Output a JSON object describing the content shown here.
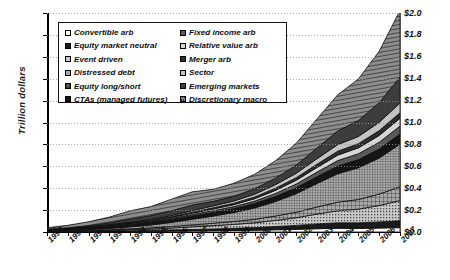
{
  "chart_data": {
    "type": "area",
    "stacked": true,
    "title": "",
    "xlabel": "",
    "ylabel": "Trillion dollars",
    "ylim": [
      0.0,
      2.0
    ],
    "ytick_step": 0.2,
    "grid": true,
    "legend_position": "top-left-inside",
    "x": [
      1990,
      1991,
      1992,
      1993,
      1994,
      1995,
      1996,
      1997,
      1998,
      1999,
      2000,
      2001,
      2002,
      2003,
      2004,
      2005,
      2006,
      2007
    ],
    "yticks": [
      "$0.0",
      "$0.2",
      "$0.4",
      "$0.6",
      "$0.8",
      "$1.0",
      "$1.2",
      "$1.4",
      "$1.6",
      "$1.8",
      "$2.0"
    ],
    "xticklabels": [
      "1990",
      "1991",
      "1992",
      "1993",
      "1994",
      "1995",
      "1996",
      "1997",
      "1998",
      "1999",
      "2000",
      "2001",
      "2002",
      "2003",
      "2004",
      "2005",
      "2006",
      "2007"
    ],
    "series": [
      {
        "name": "Convertible arb",
        "fill": "#ffffff",
        "pattern": "solid",
        "values": [
          0.001,
          0.002,
          0.003,
          0.004,
          0.005,
          0.006,
          0.008,
          0.01,
          0.012,
          0.014,
          0.016,
          0.02,
          0.024,
          0.03,
          0.034,
          0.032,
          0.036,
          0.04
        ]
      },
      {
        "name": "Equity market neutral",
        "fill": "#1a1a1a",
        "pattern": "solid",
        "values": [
          0.001,
          0.002,
          0.003,
          0.004,
          0.006,
          0.008,
          0.01,
          0.013,
          0.016,
          0.02,
          0.024,
          0.03,
          0.036,
          0.044,
          0.05,
          0.052,
          0.056,
          0.062
        ]
      },
      {
        "name": "Event driven",
        "fill": "#b4b4b4",
        "pattern": "dots",
        "values": [
          0.002,
          0.003,
          0.005,
          0.007,
          0.01,
          0.013,
          0.018,
          0.024,
          0.03,
          0.036,
          0.044,
          0.056,
          0.07,
          0.09,
          0.11,
          0.125,
          0.15,
          0.185
        ]
      },
      {
        "name": "Distressed debt",
        "fill": "#8a8a8a",
        "pattern": "grid",
        "values": [
          0.002,
          0.003,
          0.004,
          0.006,
          0.008,
          0.011,
          0.014,
          0.018,
          0.022,
          0.026,
          0.032,
          0.04,
          0.05,
          0.064,
          0.078,
          0.088,
          0.104,
          0.126
        ]
      },
      {
        "name": "Equity long/short",
        "fill": "#707070",
        "pattern": "grid-fine",
        "values": [
          0.003,
          0.005,
          0.008,
          0.012,
          0.018,
          0.026,
          0.038,
          0.052,
          0.066,
          0.082,
          0.104,
          0.132,
          0.17,
          0.215,
          0.26,
          0.29,
          0.33,
          0.39
        ]
      },
      {
        "name": "CTAs (managed futures)",
        "fill": "#151515",
        "pattern": "solid",
        "values": [
          0.01,
          0.013,
          0.016,
          0.02,
          0.022,
          0.024,
          0.027,
          0.03,
          0.033,
          0.036,
          0.04,
          0.046,
          0.054,
          0.062,
          0.07,
          0.074,
          0.082,
          0.092
        ]
      },
      {
        "name": "Fixed income arb",
        "fill": "#5a5a5a",
        "pattern": "solid",
        "values": [
          0.001,
          0.002,
          0.003,
          0.004,
          0.006,
          0.008,
          0.01,
          0.013,
          0.016,
          0.018,
          0.022,
          0.028,
          0.034,
          0.042,
          0.05,
          0.054,
          0.062,
          0.072
        ]
      },
      {
        "name": "Relative value arb",
        "fill": "#d6d6d6",
        "pattern": "solid",
        "values": [
          0.001,
          0.002,
          0.003,
          0.004,
          0.005,
          0.007,
          0.009,
          0.012,
          0.015,
          0.018,
          0.022,
          0.028,
          0.034,
          0.042,
          0.05,
          0.054,
          0.062,
          0.072
        ]
      },
      {
        "name": "Merger arb",
        "fill": "#2e2e2e",
        "pattern": "solid",
        "values": [
          0.001,
          0.001,
          0.002,
          0.003,
          0.004,
          0.005,
          0.007,
          0.009,
          0.011,
          0.013,
          0.016,
          0.02,
          0.024,
          0.03,
          0.036,
          0.038,
          0.044,
          0.05
        ]
      },
      {
        "name": "Sector",
        "fill": "#c4c4c4",
        "pattern": "solid",
        "values": [
          0.001,
          0.002,
          0.003,
          0.004,
          0.006,
          0.008,
          0.01,
          0.014,
          0.017,
          0.02,
          0.025,
          0.032,
          0.04,
          0.05,
          0.06,
          0.066,
          0.076,
          0.09
        ]
      },
      {
        "name": "Emerging markets",
        "fill": "#3d3d3d",
        "pattern": "solid",
        "values": [
          0.002,
          0.004,
          0.008,
          0.016,
          0.028,
          0.034,
          0.044,
          0.052,
          0.042,
          0.044,
          0.05,
          0.06,
          0.074,
          0.098,
          0.125,
          0.145,
          0.18,
          0.235
        ]
      },
      {
        "name": "Discretionary macro",
        "fill": "#787878",
        "pattern": "diag",
        "values": [
          0.014,
          0.022,
          0.035,
          0.052,
          0.075,
          0.082,
          0.105,
          0.12,
          0.11,
          0.118,
          0.132,
          0.158,
          0.2,
          0.265,
          0.33,
          0.38,
          0.47,
          0.61
        ]
      }
    ]
  },
  "legend": {
    "items": [
      {
        "label": "Convertible arb",
        "swatch": "#ffffff",
        "pattern": "solid"
      },
      {
        "label": "Equity market neutral",
        "swatch": "#1a1a1a",
        "pattern": "solid"
      },
      {
        "label": "Event driven",
        "swatch": "#b4b4b4",
        "pattern": "dots"
      },
      {
        "label": "Distressed debt",
        "swatch": "#8a8a8a",
        "pattern": "grid"
      },
      {
        "label": "Equity long/short",
        "swatch": "#707070",
        "pattern": "grid-fine"
      },
      {
        "label": "CTAs (managed futures)",
        "swatch": "#151515",
        "pattern": "solid"
      },
      {
        "label": "Fixed income arb",
        "swatch": "#5a5a5a",
        "pattern": "solid"
      },
      {
        "label": "Relative value arb",
        "swatch": "#d6d6d6",
        "pattern": "solid"
      },
      {
        "label": "Merger arb",
        "swatch": "#2e2e2e",
        "pattern": "solid"
      },
      {
        "label": "Sector",
        "swatch": "#c4c4c4",
        "pattern": "solid"
      },
      {
        "label": "Emerging markets",
        "swatch": "#3d3d3d",
        "pattern": "solid"
      },
      {
        "label": "Discretionary macro",
        "swatch": "#787878",
        "pattern": "diag"
      }
    ]
  },
  "axis": {
    "y_title": "Trillion dollars"
  }
}
